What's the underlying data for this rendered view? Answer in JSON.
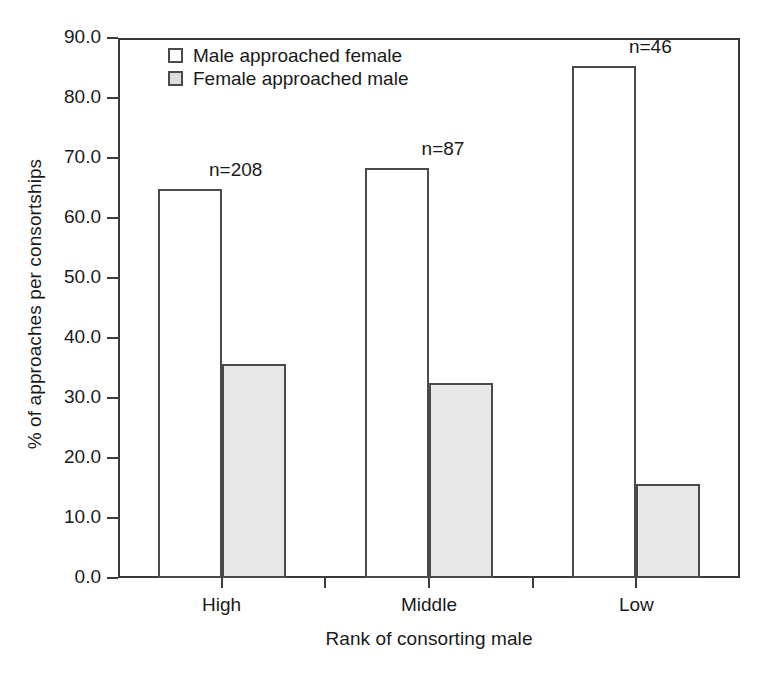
{
  "chart_data": {
    "type": "bar",
    "title": "",
    "subtitle": "",
    "xlabel": "Rank of consorting male",
    "ylabel": "% of approaches per consortships",
    "categories": [
      "High",
      "Middle",
      "Low"
    ],
    "series": [
      {
        "name": "Male approached female",
        "color": "#ffffff",
        "values": [
          64.8,
          68.3,
          85.3
        ]
      },
      {
        "name": "Female approached male",
        "color": "#e8e8e8",
        "values": [
          35.7,
          32.5,
          15.7
        ]
      }
    ],
    "annotations": [
      {
        "text": "n=208",
        "category": "High"
      },
      {
        "text": "n=87",
        "category": "Middle"
      },
      {
        "text": "n=46",
        "category": "Low"
      }
    ],
    "ylim": [
      0.0,
      90.0
    ],
    "ytick_step": 10.0,
    "ytick_labels": [
      "0.0",
      "10.0",
      "20.0",
      "30.0",
      "40.0",
      "50.0",
      "60.0",
      "70.0",
      "80.0",
      "90.0"
    ],
    "ytick_values": [
      0,
      10,
      20,
      30,
      40,
      50,
      60,
      70,
      80,
      90
    ],
    "grid": false,
    "legend_position": "top-left"
  }
}
